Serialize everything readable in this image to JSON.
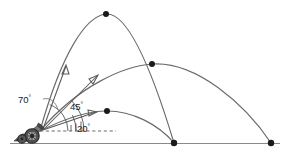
{
  "figure": {
    "background_color": "#ffffff",
    "curve_color": "#6a6a6a",
    "marker_color": "#1a1a1a",
    "ground_color": "#8a8a8a"
  },
  "labels": {
    "angle_high": "70",
    "angle_mid": "45",
    "angle_low": "20",
    "degree_symbol": "°"
  },
  "chart_data": {
    "type": "line",
    "xlabel": "",
    "ylabel": "",
    "grid": false,
    "legend": "none",
    "launch_origin": {
      "x": 40,
      "y": 131
    },
    "ground_y": 143,
    "series": [
      {
        "name": "70",
        "label": "70°",
        "apex": {
          "x": 106,
          "y": 14
        },
        "landing": {
          "x": 174,
          "y": 143
        },
        "path": "M40,131 C62,52 86,16 106,14 C128,12 152,70 174,143",
        "apex_marker": true,
        "landing_marker": true
      },
      {
        "name": "45",
        "label": "45°",
        "apex": {
          "x": 152,
          "y": 64
        },
        "landing": {
          "x": 271,
          "y": 143
        },
        "path": "M40,131 C78,86 124,66 152,64 C196,61 245,104 271,143",
        "apex_marker": true,
        "landing_marker": true
      },
      {
        "name": "20",
        "label": "20°",
        "apex": {
          "x": 107,
          "y": 111
        },
        "landing": {
          "x": 174,
          "y": 143
        },
        "path": "M40,131 C68,117 92,111 107,111 C132,111 158,124 174,143",
        "apex_marker": true,
        "landing_marker": true
      }
    ],
    "reference_line": {
      "style": "dashed",
      "from": {
        "x": 40,
        "y": 131
      },
      "to": {
        "x": 116,
        "y": 131
      }
    },
    "markers": [
      {
        "x": 106,
        "y": 14
      },
      {
        "x": 152,
        "y": 64
      },
      {
        "x": 107,
        "y": 111
      },
      {
        "x": 174,
        "y": 143
      },
      {
        "x": 271,
        "y": 143
      }
    ]
  },
  "launcher": {
    "name": "cannon",
    "position": {
      "x": 32,
      "y": 133
    }
  }
}
